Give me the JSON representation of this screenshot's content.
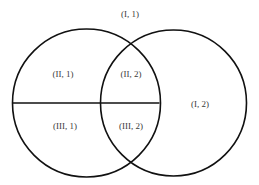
{
  "diagram": {
    "type": "venn-partition",
    "width": 259,
    "height": 185,
    "colors": {
      "background": "#ffffff",
      "stroke": "#111111",
      "text": "#3a3a3a"
    },
    "circles": [
      {
        "id": "left-circle",
        "cx": 86.5,
        "cy": 103,
        "r": 74
      },
      {
        "id": "right-circle",
        "cx": 173.5,
        "cy": 103,
        "r": 73
      }
    ],
    "divider": {
      "x1": 14,
      "y1": 103,
      "x2": 159,
      "y2": 103
    },
    "labels": {
      "outside": "(I, 1)",
      "left_top": "(II, 1)",
      "overlap_top": "(II, 2)",
      "left_bottom": "(III, 1)",
      "overlap_bottom": "(III, 2)",
      "right_only": "(I, 2)"
    }
  }
}
